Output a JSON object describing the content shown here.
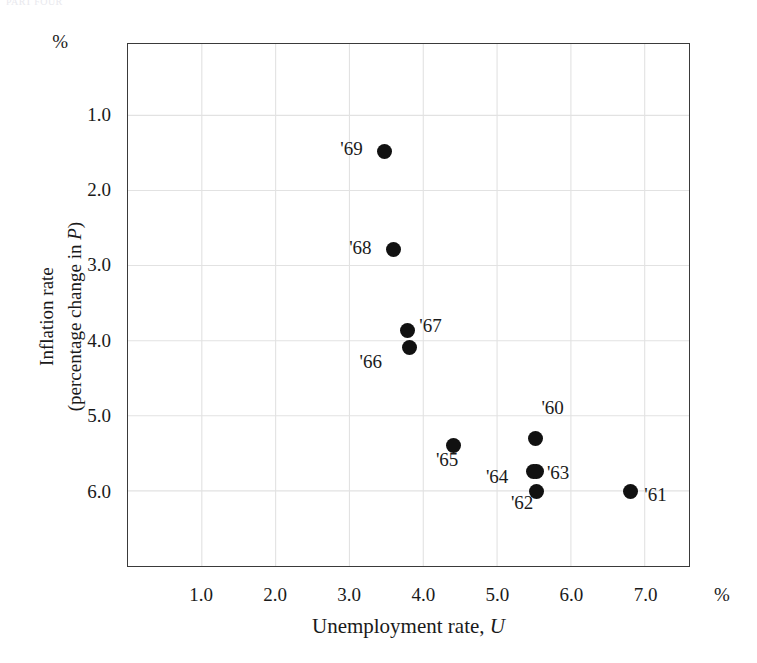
{
  "page": {
    "running_head": "PART FOUR"
  },
  "axes": {
    "y_unit": "%",
    "x_unit": "%",
    "y_title_line1": "Inflation rate",
    "y_title_line2_prefix": "(percentage change in ",
    "y_title_line2_italic": "P",
    "y_title_line2_suffix": ")",
    "x_title_prefix": "Unemployment rate, ",
    "x_title_italic": "U",
    "y_ticks": [
      "6.0",
      "5.0",
      "4.0",
      "3.0",
      "2.0",
      "1.0"
    ],
    "x_ticks": [
      "1.0",
      "2.0",
      "3.0",
      "4.0",
      "5.0",
      "6.0",
      "7.0"
    ],
    "grid_color": "#e2e2e2",
    "frame_color": "#3a3a3a",
    "line_color": "#7c7c7c",
    "marker_color": "#111111"
  },
  "chart_data": {
    "type": "scatter",
    "title": "",
    "subtitle": "",
    "xlabel": "Unemployment rate, U",
    "ylabel": "Inflation rate (percentage change in P)",
    "xlim": [
      0.0,
      7.6
    ],
    "ylim": [
      0.0,
      6.95
    ],
    "xticks": [
      1.0,
      2.0,
      3.0,
      4.0,
      5.0,
      6.0,
      7.0
    ],
    "yticks": [
      1.0,
      2.0,
      3.0,
      4.0,
      5.0,
      6.0
    ],
    "grid": true,
    "legend": "none",
    "connected": true,
    "series": [
      {
        "name": "Phillips curve 1960-1969",
        "points": [
          {
            "label": "'60",
            "x": 5.5,
            "y": 1.72,
            "label_dx": 6,
            "label_dy": -30
          },
          {
            "label": "'61",
            "x": 6.78,
            "y": 1.02,
            "label_dx": 14,
            "label_dy": 4
          },
          {
            "label": "'62",
            "x": 5.52,
            "y": 1.02,
            "label_dx": -26,
            "label_dy": 12
          },
          {
            "label": "'63",
            "x": 5.52,
            "y": 1.28,
            "label_dx": 10,
            "label_dy": 2
          },
          {
            "label": "'64",
            "x": 5.48,
            "y": 1.28,
            "label_dx": -48,
            "label_dy": 6
          },
          {
            "label": "'65",
            "x": 4.4,
            "y": 1.62,
            "label_dx": -18,
            "label_dy": 14
          },
          {
            "label": "'66",
            "x": 3.8,
            "y": 2.92,
            "label_dx": -50,
            "label_dy": 14
          },
          {
            "label": "'67",
            "x": 3.77,
            "y": 3.15,
            "label_dx": 12,
            "label_dy": -5
          },
          {
            "label": "'68",
            "x": 3.58,
            "y": 4.22,
            "label_dx": -44,
            "label_dy": -2
          },
          {
            "label": "'69",
            "x": 3.46,
            "y": 5.53,
            "label_dx": -44,
            "label_dy": -2
          }
        ],
        "path_order": [
          "'69",
          "'68",
          "'67",
          "'66",
          "'65",
          "'63",
          "'60",
          "'61",
          "'62",
          "'64"
        ]
      }
    ]
  }
}
